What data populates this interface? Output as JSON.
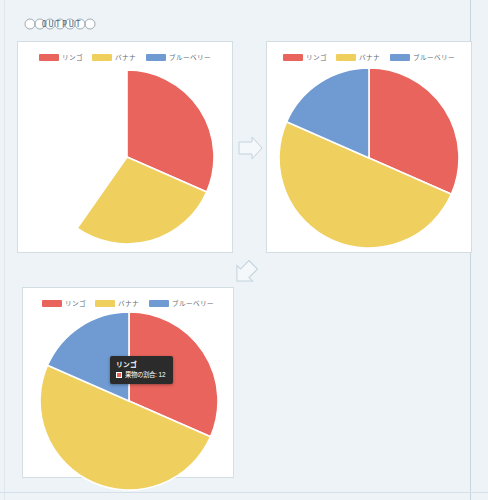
{
  "badge": {
    "label": "OUTPUT"
  },
  "colors": {
    "apple": "#e8645c",
    "banana": "#efcf5e",
    "blueberry": "#6f9bd2",
    "panel_border": "#d3dde4",
    "page_background": "#eef3f7",
    "tooltip_background": "#2b2b2b",
    "legend_text": "#5e6b74"
  },
  "legend": {
    "items": [
      {
        "label": "リンゴ",
        "color": "#e8645c",
        "icon": "legend-swatch-apple"
      },
      {
        "label": "バナナ",
        "color": "#efcf5e",
        "icon": "legend-swatch-banana"
      },
      {
        "label": "ブルーベリー",
        "color": "#6f9bd2",
        "icon": "legend-swatch-blueberry"
      }
    ]
  },
  "arrows": [
    {
      "name": "arrow-right-icon",
      "direction": "right"
    },
    {
      "name": "arrow-diagonal-icon",
      "direction": "down-left"
    }
  ],
  "tooltip": {
    "title": "リンゴ",
    "value_label": "果物の割合: 12",
    "swatch_color": "#e8645c"
  },
  "chart_data": [
    {
      "id": "panel-1",
      "type": "pie",
      "title": "",
      "state": "animating",
      "sweep_degrees": 215,
      "start_angle_degrees": 0,
      "legend_position": "top",
      "categories": [
        "リンゴ",
        "バナナ",
        "ブルーベリー"
      ],
      "values": [
        12,
        19,
        7
      ],
      "colors": [
        "#e8645c",
        "#efcf5e",
        "#6f9bd2"
      ],
      "value_label": "果物の割合"
    },
    {
      "id": "panel-2",
      "type": "pie",
      "title": "",
      "state": "complete",
      "sweep_degrees": 360,
      "start_angle_degrees": 0,
      "legend_position": "top",
      "categories": [
        "リンゴ",
        "バナナ",
        "ブルーベリー"
      ],
      "values": [
        12,
        19,
        7
      ],
      "colors": [
        "#e8645c",
        "#efcf5e",
        "#6f9bd2"
      ],
      "value_label": "果物の割合"
    },
    {
      "id": "panel-3",
      "type": "pie",
      "title": "",
      "state": "hover-tooltip",
      "sweep_degrees": 360,
      "start_angle_degrees": 0,
      "legend_position": "top",
      "categories": [
        "リンゴ",
        "バナナ",
        "ブルーベリー"
      ],
      "values": [
        12,
        19,
        7
      ],
      "colors": [
        "#e8645c",
        "#efcf5e",
        "#6f9bd2"
      ],
      "value_label": "果物の割合",
      "hovered_slice": "リンゴ",
      "hovered_value": 12
    }
  ]
}
